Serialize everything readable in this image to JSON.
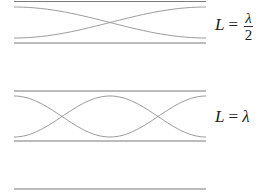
{
  "panels": [
    {
      "name": "half-wavelength",
      "mode_halfwaves": 1,
      "label": {
        "var": "L",
        "eq": "=",
        "numerator": "λ",
        "denominator": "2"
      }
    },
    {
      "name": "full-wavelength",
      "mode_halfwaves": 2,
      "label": {
        "var": "L",
        "eq": "=",
        "value": "λ"
      }
    }
  ],
  "colors": {
    "wall": "#7a7a7a",
    "wave": "#9a9a9a",
    "text": "#222222"
  }
}
